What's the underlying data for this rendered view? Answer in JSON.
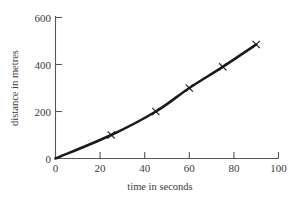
{
  "chart_data": {
    "type": "line",
    "title": "",
    "xlabel": "time in seconds",
    "ylabel": "distance in metres",
    "xlim": [
      0,
      100
    ],
    "ylim": [
      0,
      600
    ],
    "xticks": [
      0,
      20,
      40,
      60,
      80,
      100
    ],
    "yticks": [
      0,
      200,
      400,
      600
    ],
    "xticklabels": [
      "0",
      "20",
      "40",
      "60",
      "80",
      "100"
    ],
    "yticklabels": [
      "0",
      "200",
      "400",
      "600"
    ],
    "grid": false,
    "legend": null,
    "marker": "x",
    "line_color": "#1a1a1a",
    "axis_color": "#555555",
    "series": [
      {
        "name": "distance",
        "x": [
          0,
          25,
          45,
          60,
          75,
          90
        ],
        "y": [
          0,
          100,
          200,
          300,
          390,
          485
        ]
      }
    ]
  },
  "axes": {
    "x_title": "time in seconds",
    "y_title": "distance in metres",
    "x_tick_0": "0",
    "x_tick_1": "20",
    "x_tick_2": "40",
    "x_tick_3": "60",
    "x_tick_4": "80",
    "x_tick_5": "100",
    "y_tick_0": "0",
    "y_tick_1": "200",
    "y_tick_2": "400",
    "y_tick_3": "600"
  }
}
